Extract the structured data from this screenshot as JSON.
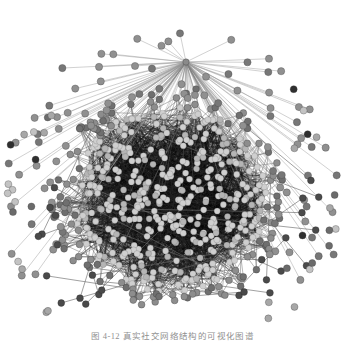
{
  "figure": {
    "type": "network-graph",
    "caption": "图 4-12  真实社交网络结构的可视化图谱",
    "background_color": "#ffffff",
    "width": 345,
    "height": 343
  },
  "palette": {
    "background": "#ffffff",
    "edge_core": "#1a1a1a",
    "edge_mid": "#6f6f6f",
    "edge_spoke": "#b8b8b8",
    "node_core_light": "#c9c9c9",
    "node_mid": "#8d8d8d",
    "node_dark": "#3b3b3b",
    "node_pale": "#b9b9b9",
    "caption_color": "#4a4a4a"
  },
  "chart_data": {
    "type": "scatter",
    "title": "",
    "xlabel": "",
    "ylabel": "",
    "layout": "force-directed hairball",
    "grid": false,
    "legend": "none",
    "axis_visible": false,
    "xlim": [
      0,
      345
    ],
    "ylim": [
      0,
      330
    ],
    "core": {
      "center_x": 170,
      "center_y": 199,
      "radius": 96,
      "node_count": 430,
      "node_radius": 3.1,
      "node_color": "#c9c9c9",
      "edge_color": "#141414",
      "edge_count": 2600,
      "edge_width": 0.55,
      "description": "dense near-black core disk of light gray nodes"
    },
    "rim": {
      "inner_radius": 96,
      "outer_radius": 118,
      "node_count": 120,
      "node_radius": 3.4,
      "node_color": "#7b7b7b",
      "edge_color": "#555555",
      "description": "fringe nodes attached to core boundary"
    },
    "hub": {
      "x": 186,
      "y": 62,
      "spoke_count": 92,
      "spoke_color": "#b0b0b0",
      "spoke_width": 0.5,
      "description": "star hub above the core radiating spokes to the upper arc"
    },
    "spoke_ring": {
      "node_count": 92,
      "node_radius": 3.6,
      "node_color": "#8a8a8a",
      "angle_start_deg": 150,
      "angle_end_deg": 392,
      "radius_min": 104,
      "radius_max": 178,
      "description": "upper/left arc of leaf nodes connected to the hub"
    },
    "isolates": {
      "node_count": 34,
      "node_radius": 3.5,
      "colors": [
        "#2f2f2f",
        "#6b6b6b",
        "#a7a7a7",
        "#c3c3c3"
      ],
      "description": "unconnected nodes scattered on the outer left and right arcs"
    },
    "pendants": {
      "node_count": 26,
      "node_radius": 3.4,
      "node_color": "#4a4a4a",
      "edge_color": "#707070",
      "description": "short-chain pendant nodes on lower-left and lower-right"
    }
  }
}
